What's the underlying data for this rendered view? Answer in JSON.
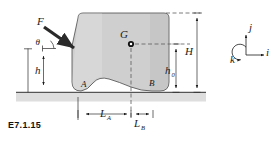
{
  "figure": {
    "id_label": "E7.1.15",
    "caption_position": "bottom-left",
    "background_color": "#ffffff"
  },
  "colors": {
    "body_fill": "#cfcfcf",
    "body_stroke": "#4a4a4a",
    "ground_band": "#dedede",
    "line": "#1a1a1a",
    "dashed": "#5a5a5a",
    "arrow_force": "#2a2a2a"
  },
  "labels": {
    "force": "F",
    "angle": "θ",
    "height_small": "h",
    "centroid": "G",
    "contact_left": "A",
    "contact_right": "B",
    "total_height": "H",
    "centroid_height": "h",
    "centroid_height_sub": "0",
    "length_a": "L",
    "length_a_sub": "A",
    "length_b": "L",
    "length_b_sub": "B",
    "unit_i": "i",
    "unit_j": "j",
    "unit_k": "k"
  },
  "semantics": {
    "force_description": "Applied force F on left face at angle theta below horizontal",
    "centroid_description": "Center of mass G marked with dot",
    "contacts": [
      "A",
      "B"
    ],
    "dimensions": [
      "h",
      "H",
      "h0",
      "LA",
      "LB"
    ],
    "triad": [
      "i",
      "j",
      "k"
    ]
  }
}
